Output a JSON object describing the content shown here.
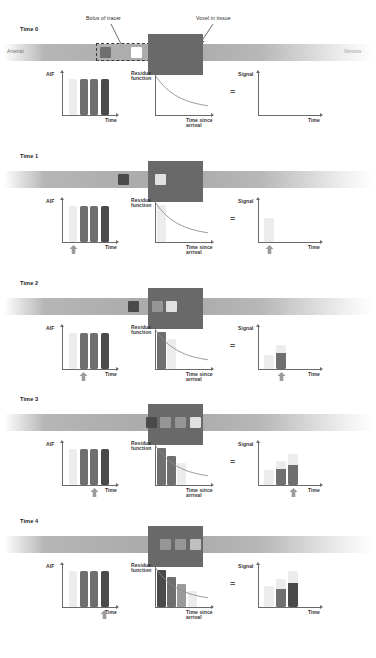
{
  "figure": {
    "annotations": {
      "bolus": "Bolus of tracer",
      "voxel": "Voxel in tissue"
    },
    "vessel": {
      "arterial_label": "Arterial",
      "venous_label": "Venous"
    },
    "axis_labels": {
      "aif": "AIF",
      "residue_line1": "Residue",
      "residue_line2": "function",
      "signal": "Signal",
      "time": "Time",
      "time_since_line1": "Time since",
      "time_since_line2": "arrival",
      "equals": "="
    },
    "colors": {
      "vessel": "#a8a8a8",
      "voxel": "#696969",
      "tracer_darkest": "#4a4a4a",
      "tracer_dark": "#6f6f6f",
      "tracer_mid": "#9a9a9a",
      "tracer_light": "#c7c7c7",
      "tracer_lightest": "#ececec",
      "axis": "#6a6a6a",
      "curve": "#8a8a8a",
      "arrow_marker": "#9b9b9b",
      "text": "#2b2b2b"
    },
    "timepoints": [
      {
        "label": "Time 0",
        "vessel_squares": [
          {
            "x": 100,
            "shade": "tracer_dark"
          },
          {
            "x": 131,
            "shade": "white"
          }
        ],
        "voxel_squares": [],
        "aif_bars": [
          {
            "shade": "tracer_lightest",
            "height": 1.0,
            "highlight": false
          },
          {
            "shade": "tracer_dark",
            "height": 1.0,
            "highlight": false
          },
          {
            "shade": "tracer_dark",
            "height": 1.0,
            "highlight": false
          },
          {
            "shade": "tracer_darkest",
            "height": 1.0,
            "highlight": false
          }
        ],
        "residue_bars": [],
        "signal_bars": [],
        "marker_aif": null,
        "marker_signal": null
      },
      {
        "label": "Time 1",
        "vessel_squares": [
          {
            "x": 118,
            "shade": "tracer_darkest"
          }
        ],
        "voxel_squares": [
          {
            "x": 155,
            "shade": "tracer_lightest"
          }
        ],
        "aif_bars": [
          {
            "shade": "tracer_lightest",
            "height": 1.0,
            "highlight": true
          },
          {
            "shade": "tracer_dark",
            "height": 1.0,
            "highlight": false
          },
          {
            "shade": "tracer_dark",
            "height": 1.0,
            "highlight": false
          },
          {
            "shade": "tracer_darkest",
            "height": 1.0,
            "highlight": false
          }
        ],
        "residue_bars": [
          {
            "shade": "tracer_lightest",
            "height": 1.0
          }
        ],
        "signal_bars": [
          {
            "shade": "tracer_lightest",
            "height": 0.62
          }
        ],
        "marker_aif": 0,
        "marker_signal": 0
      },
      {
        "label": "Time 2",
        "vessel_squares": [
          {
            "x": 128,
            "shade": "tracer_darkest"
          }
        ],
        "voxel_squares": [
          {
            "x": 152,
            "shade": "tracer_mid"
          },
          {
            "x": 166,
            "shade": "tracer_lightest"
          }
        ],
        "aif_bars": [
          {
            "shade": "tracer_lightest",
            "height": 1.0,
            "highlight": false
          },
          {
            "shade": "tracer_dark",
            "height": 1.0,
            "highlight": true
          },
          {
            "shade": "tracer_dark",
            "height": 1.0,
            "highlight": false
          },
          {
            "shade": "tracer_darkest",
            "height": 1.0,
            "highlight": false
          }
        ],
        "residue_bars": [
          {
            "shade": "tracer_dark",
            "height": 1.0
          },
          {
            "shade": "tracer_lightest",
            "height": 0.8
          }
        ],
        "signal_bars": [
          {
            "shade": "tracer_lightest",
            "height": 0.38
          },
          {
            "shade": "tracer_dark",
            "height": 0.62
          }
        ],
        "marker_aif": 1,
        "marker_signal": 1
      },
      {
        "label": "Time 3",
        "vessel_squares": [
          {
            "x": 146,
            "shade": "tracer_darkest"
          }
        ],
        "voxel_squares": [
          {
            "x": 160,
            "shade": "tracer_mid"
          },
          {
            "x": 175,
            "shade": "tracer_mid"
          },
          {
            "x": 190,
            "shade": "tracer_lightest"
          }
        ],
        "aif_bars": [
          {
            "shade": "tracer_lightest",
            "height": 1.0,
            "highlight": false
          },
          {
            "shade": "tracer_dark",
            "height": 1.0,
            "highlight": false
          },
          {
            "shade": "tracer_dark",
            "height": 1.0,
            "highlight": true
          },
          {
            "shade": "tracer_darkest",
            "height": 1.0,
            "highlight": false
          }
        ],
        "residue_bars": [
          {
            "shade": "tracer_dark",
            "height": 1.0
          },
          {
            "shade": "tracer_dark",
            "height": 0.78
          },
          {
            "shade": "tracer_lightest",
            "height": 0.6
          }
        ],
        "signal_bars": [
          {
            "shade": "tracer_lightest",
            "height": 0.4
          },
          {
            "shade": "tracer_dark",
            "height": 0.62
          },
          {
            "shade": "tracer_dark",
            "height": 0.82
          }
        ],
        "marker_aif": 2,
        "marker_signal": 2
      },
      {
        "label": "Time 4",
        "vessel_squares": [],
        "voxel_squares": [
          {
            "x": 160,
            "shade": "tracer_mid"
          },
          {
            "x": 175,
            "shade": "tracer_mid"
          },
          {
            "x": 190,
            "shade": "tracer_light"
          }
        ],
        "aif_bars": [
          {
            "shade": "tracer_lightest",
            "height": 1.0,
            "highlight": false
          },
          {
            "shade": "tracer_dark",
            "height": 1.0,
            "highlight": false
          },
          {
            "shade": "tracer_dark",
            "height": 1.0,
            "highlight": false
          },
          {
            "shade": "tracer_darkest",
            "height": 1.0,
            "highlight": true
          }
        ],
        "residue_bars": [
          {
            "shade": "tracer_darkest",
            "height": 1.0
          },
          {
            "shade": "tracer_dark",
            "height": 0.8
          },
          {
            "shade": "tracer_mid",
            "height": 0.62
          },
          {
            "shade": "tracer_lightest",
            "height": 0.42
          }
        ],
        "signal_bars": [
          {
            "shade": "tracer_lightest",
            "height": 0.55
          },
          {
            "shade": "tracer_dark",
            "height": 0.75
          },
          {
            "shade": "tracer_darkest",
            "height": 0.95
          }
        ],
        "marker_aif": 3,
        "marker_signal": 3
      }
    ]
  },
  "chart_data": {
    "type": "bar",
    "panels": [
      "AIF",
      "Residue function",
      "Signal"
    ],
    "xlabels": [
      "Time",
      "Time since arrival",
      "Time"
    ],
    "categories": [
      "t1",
      "t2",
      "t3",
      "t4"
    ],
    "series": [
      {
        "name": "AIF",
        "values": [
          1.0,
          1.0,
          1.0,
          1.0
        ]
      },
      {
        "name": "Residue function (Time 4)",
        "values": [
          1.0,
          0.8,
          0.62,
          0.42
        ]
      },
      {
        "name": "Signal (Time 4)",
        "values": [
          0.55,
          0.75,
          0.95,
          0
        ]
      }
    ],
    "grid": false,
    "legend": "none"
  }
}
